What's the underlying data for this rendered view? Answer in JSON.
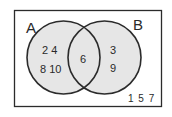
{
  "diagram": {
    "type": "venn",
    "sets": [
      {
        "label": "A",
        "only": [
          "2",
          "4",
          "8",
          "10"
        ]
      },
      {
        "label": "B",
        "only": [
          "3",
          "9"
        ]
      }
    ],
    "intersection": [
      "6"
    ],
    "outside": [
      "1",
      "5",
      "7"
    ],
    "text": {
      "set_a_label": "A",
      "set_b_label": "B",
      "a_only_row1": "2 4",
      "a_only_row2": "8 10",
      "intersection": "6",
      "b_only_row1": "3",
      "b_only_row2": "9",
      "outside": "1 5 7"
    },
    "colors": {
      "fill": "#e6e6e6",
      "stroke": "#2b2b2b",
      "background": "#ffffff"
    }
  }
}
